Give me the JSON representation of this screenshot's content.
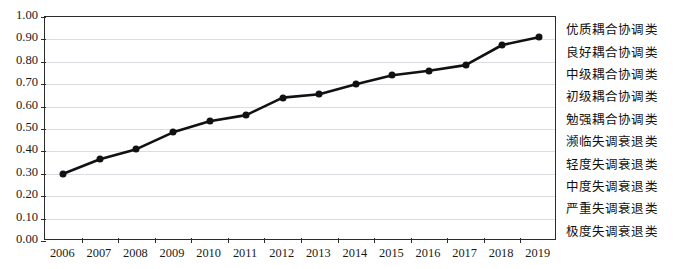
{
  "chart_data": {
    "type": "line",
    "title": "",
    "subtitle": "",
    "xlabel": "",
    "ylabel": "",
    "xlim": [
      "2006",
      "2019"
    ],
    "ylim": [
      0.0,
      1.0
    ],
    "ytick_step": 0.1,
    "grid": true,
    "legend": null,
    "marker": "filled-circle",
    "line_color": "#111111",
    "grid_color": "#d9dde2",
    "axis_color": "#2b2b2b",
    "categories": [
      "2006",
      "2007",
      "2008",
      "2009",
      "2010",
      "2011",
      "2012",
      "2013",
      "2014",
      "2015",
      "2016",
      "2017",
      "2018",
      "2019"
    ],
    "values": [
      0.3,
      0.365,
      0.41,
      0.485,
      0.535,
      0.562,
      0.64,
      0.655,
      0.7,
      0.74,
      0.76,
      0.785,
      0.875,
      0.91
    ],
    "series": [
      {
        "name": "",
        "values": [
          0.3,
          0.365,
          0.41,
          0.485,
          0.535,
          0.562,
          0.64,
          0.655,
          0.7,
          0.74,
          0.76,
          0.785,
          0.875,
          0.91
        ]
      }
    ],
    "ytick_labels": [
      "1.00",
      "0.90",
      "0.80",
      "0.70",
      "0.60",
      "0.50",
      "0.40",
      "0.30",
      "0.20",
      "0.10",
      "0.00"
    ],
    "ytick_values": [
      1.0,
      0.9,
      0.8,
      0.7,
      0.6,
      0.5,
      0.4,
      0.3,
      0.2,
      0.1,
      0.0
    ],
    "xtick_labels": [
      "2006",
      "2007",
      "2008",
      "2009",
      "2010",
      "2011",
      "2012",
      "2013",
      "2014",
      "2015",
      "2016",
      "2017",
      "2018",
      "2019"
    ],
    "right_band_labels": [
      {
        "label": "优质耦合协调类",
        "range": [
          0.9,
          1.0
        ]
      },
      {
        "label": "良好耦合协调类",
        "range": [
          0.8,
          0.9
        ]
      },
      {
        "label": "中级耦合协调类",
        "range": [
          0.7,
          0.8
        ]
      },
      {
        "label": "初级耦合协调类",
        "range": [
          0.6,
          0.7
        ]
      },
      {
        "label": "勉强耦合协调类",
        "range": [
          0.5,
          0.6
        ]
      },
      {
        "label": "濒临失调衰退类",
        "range": [
          0.4,
          0.5
        ]
      },
      {
        "label": "轻度失调衰退类",
        "range": [
          0.3,
          0.4
        ]
      },
      {
        "label": "中度失调衰退类",
        "range": [
          0.2,
          0.3
        ]
      },
      {
        "label": "严重失调衰退类",
        "range": [
          0.1,
          0.2
        ]
      },
      {
        "label": "极度失调衰退类",
        "range": [
          0.0,
          0.1
        ]
      }
    ]
  }
}
